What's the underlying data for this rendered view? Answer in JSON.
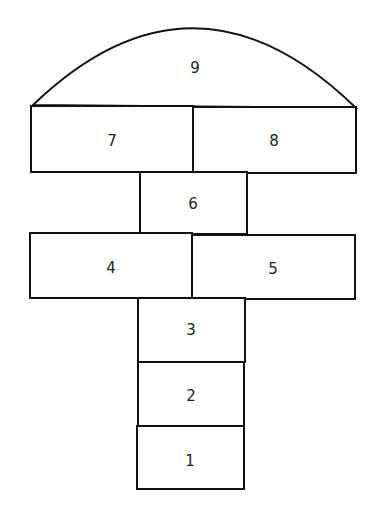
{
  "diagram": {
    "type": "hopscotch-court",
    "squares": [
      {
        "label": "1"
      },
      {
        "label": "2"
      },
      {
        "label": "3"
      },
      {
        "label": "4"
      },
      {
        "label": "5"
      },
      {
        "label": "6"
      },
      {
        "label": "7"
      },
      {
        "label": "8"
      },
      {
        "label": "9"
      }
    ],
    "colors": {
      "line": "#111111",
      "background": "#ffffff",
      "text": "#222222"
    }
  }
}
